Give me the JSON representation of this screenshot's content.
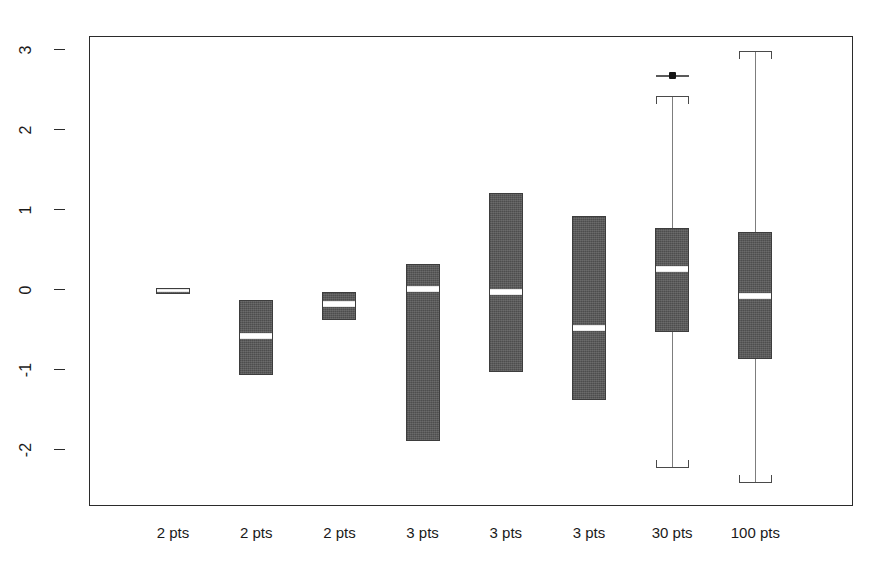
{
  "chart_data": {
    "type": "box",
    "title": "",
    "xlabel": "",
    "ylabel": "",
    "ylim": [
      -2.62,
      3.35
    ],
    "yticks": [
      3,
      2,
      1,
      0,
      -1,
      -2
    ],
    "ytick_labels": [
      "3",
      "2",
      "1",
      "0",
      "-1",
      "-2"
    ],
    "grid": false,
    "legend": "none",
    "categories": [
      "2 pts",
      "2 pts",
      "2 pts",
      "3 pts",
      "3 pts",
      "3 pts",
      "30 pts",
      "100 pts"
    ],
    "boxes": [
      {
        "label": "2 pts",
        "q1": -0.05,
        "median": -0.01,
        "q3": 0.02,
        "whisker_low": -0.05,
        "whisker_high": 0.02,
        "outliers": []
      },
      {
        "label": "2 pts",
        "q1": -1.06,
        "median": -0.57,
        "q3": -0.13,
        "whisker_low": -1.06,
        "whisker_high": -0.13,
        "outliers": []
      },
      {
        "label": "2 pts",
        "q1": -0.37,
        "median": -0.18,
        "q3": -0.02,
        "whisker_low": -0.37,
        "whisker_high": -0.02,
        "outliers": []
      },
      {
        "label": "3 pts",
        "q1": -1.89,
        "median": 0.01,
        "q3": 0.33,
        "whisker_low": -1.89,
        "whisker_high": 0.33,
        "outliers": []
      },
      {
        "label": "3 pts",
        "q1": -1.02,
        "median": -0.03,
        "q3": 1.21,
        "whisker_low": -1.02,
        "whisker_high": 1.21,
        "outliers": []
      },
      {
        "label": "3 pts",
        "q1": -1.38,
        "median": -0.47,
        "q3": 0.93,
        "whisker_low": -1.38,
        "whisker_high": 0.93,
        "outliers": []
      },
      {
        "label": "30 pts",
        "q1": -0.52,
        "median": 0.26,
        "q3": 0.77,
        "whisker_low": -2.22,
        "whisker_high": 2.42,
        "outliers": [
          2.69
        ]
      },
      {
        "label": "100 pts",
        "q1": -0.86,
        "median": -0.08,
        "q3": 0.73,
        "whisker_low": -2.41,
        "whisker_high": 2.99,
        "outliers": []
      }
    ],
    "colors": {
      "box_fill": "#5a5a5a",
      "box_edge": "#3d3d3d",
      "median": "#ffffff",
      "whisker": "#7d7d7d",
      "axis": "#2b2b2b",
      "background": "#ffffff",
      "outlier": "#151515"
    }
  },
  "axis": {
    "y_tick_labels": [
      "3",
      "2",
      "1",
      "0",
      "-1",
      "-2"
    ]
  },
  "x_labels": [
    "2 pts",
    "2 pts",
    "2 pts",
    "3 pts",
    "3 pts",
    "3 pts",
    "30 pts",
    "100 pts"
  ]
}
